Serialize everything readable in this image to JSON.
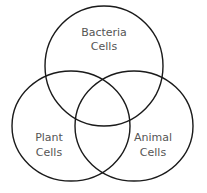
{
  "diagram": {
    "type": "venn",
    "sets": [
      {
        "id": "bacteria",
        "line1": "Bacteria",
        "line2": "Cells"
      },
      {
        "id": "plant",
        "line1": "Plant",
        "line2": "Cells"
      },
      {
        "id": "animal",
        "line1": "Animal",
        "line2": "Cells"
      }
    ],
    "colors": {
      "stroke": "#1a1a1a",
      "text": "#555555",
      "background": "#ffffff"
    }
  }
}
